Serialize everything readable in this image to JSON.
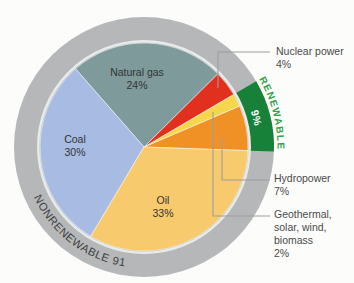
{
  "figure": {
    "background": "#fcfcfa"
  },
  "chart_data": {
    "type": "pie",
    "units": "percent",
    "start_angle_deg": -2,
    "direction": "ccw",
    "slices": [
      {
        "name": "Hydropower",
        "value": 7,
        "color": "#ef9124",
        "renewable": true
      },
      {
        "name": "Geothermal, solar, wind, biomass",
        "value": 2,
        "color": "#f6d74c",
        "renewable": true
      },
      {
        "name": "Nuclear power",
        "value": 4,
        "color": "#e2301e",
        "renewable": false
      },
      {
        "name": "Natural gas",
        "value": 24,
        "color": "#7e9a9b",
        "renewable": false
      },
      {
        "name": "Coal",
        "value": 30,
        "color": "#a8bbe2",
        "renewable": false
      },
      {
        "name": "Oil",
        "value": 33,
        "color": "#f8ca6e",
        "renewable": false
      }
    ],
    "ring": {
      "nonrenewable": {
        "label": "NONRENEWABLE 91%",
        "value": 91,
        "color": "#b5b7b9",
        "text_color": "#3f4040"
      },
      "renewable": {
        "label": "RENEWABLE",
        "value": 9,
        "color": "#17813a",
        "text_color": "#31a046",
        "inner_label": "9%",
        "inner_label_color": "#ffffff"
      }
    },
    "legend_position": "right",
    "grid": false
  },
  "inner_labels": [
    {
      "lines": [
        "Natural gas",
        "24%"
      ],
      "x": 137,
      "y": 66
    },
    {
      "lines": [
        "Coal",
        "30%"
      ],
      "x": 75,
      "y": 133
    },
    {
      "lines": [
        "Oil",
        "33%"
      ],
      "x": 163,
      "y": 194
    }
  ],
  "callouts": [
    {
      "lines": [
        "Nuclear power",
        "4%"
      ],
      "line_points": [
        [
          218,
          88
        ],
        [
          218,
          52
        ],
        [
          270,
          52
        ]
      ],
      "text_x": 276,
      "text_y": 45
    },
    {
      "lines": [
        "Hydropower",
        "7%"
      ],
      "line_points": [
        [
          222,
          137
        ],
        [
          222,
          180
        ],
        [
          270,
          180
        ]
      ],
      "text_x": 274,
      "text_y": 172
    },
    {
      "lines": [
        "Geothermal,",
        "solar, wind,",
        "biomass",
        "2%"
      ],
      "line_points": [
        [
          213,
          112
        ],
        [
          213,
          216
        ],
        [
          270,
          216
        ]
      ],
      "text_x": 274,
      "text_y": 208
    }
  ],
  "style_colors": {
    "ring_gap": "#e7ebe9",
    "leader_line": "#9ba09d",
    "slice_stroke": "rgba(255,255,255,0.65)"
  }
}
